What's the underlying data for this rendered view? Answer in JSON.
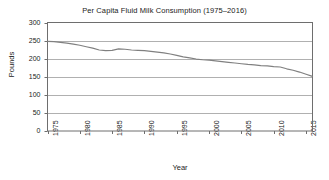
{
  "chart_data": {
    "type": "line",
    "title": "Per Capita Fluid Milk Consumption (1975–2016)",
    "xlabel": "Year",
    "ylabel": "Pounds",
    "xlim": [
      1975,
      2016
    ],
    "ylim": [
      0,
      300
    ],
    "grid": true,
    "grid_axis": "y",
    "legend": "none",
    "line_color": "#808080",
    "grid_color": "#b0b0b0",
    "axis_color": "#6e6e6e",
    "background_color": "#ffffff",
    "yticks": [
      0,
      50,
      100,
      150,
      200,
      250,
      300
    ],
    "ytick_labels": [
      "0",
      "50",
      "100",
      "150",
      "200",
      "250",
      "300"
    ],
    "xticks": [
      1975,
      1980,
      1985,
      1990,
      1995,
      2000,
      2005,
      2010,
      2015
    ],
    "xtick_labels": [
      "1975",
      "1980",
      "1985",
      "1990",
      "1995",
      "2000",
      "2005",
      "2010",
      "2015"
    ],
    "x": [
      1975,
      1976,
      1977,
      1978,
      1979,
      1980,
      1981,
      1982,
      1983,
      1984,
      1985,
      1986,
      1987,
      1988,
      1989,
      1990,
      1991,
      1992,
      1993,
      1994,
      1995,
      1996,
      1997,
      1998,
      1999,
      2000,
      2001,
      2002,
      2003,
      2004,
      2005,
      2006,
      2007,
      2008,
      2009,
      2010,
      2011,
      2012,
      2013,
      2014,
      2015,
      2016
    ],
    "values": [
      248,
      247,
      245,
      243,
      240,
      237,
      233,
      229,
      224,
      222,
      223,
      227,
      226,
      224,
      223,
      222,
      220,
      218,
      216,
      213,
      209,
      205,
      202,
      199,
      197,
      196,
      194,
      192,
      190,
      188,
      186,
      184,
      183,
      181,
      180,
      178,
      177,
      172,
      168,
      163,
      157,
      151
    ],
    "series": [
      {
        "name": "Per capita fluid milk consumption",
        "values": [
          248,
          247,
          245,
          243,
          240,
          237,
          233,
          229,
          224,
          222,
          223,
          227,
          226,
          224,
          223,
          222,
          220,
          218,
          216,
          213,
          209,
          205,
          202,
          199,
          197,
          196,
          194,
          192,
          190,
          188,
          186,
          184,
          183,
          181,
          180,
          178,
          177,
          172,
          168,
          163,
          157,
          151
        ]
      }
    ]
  }
}
